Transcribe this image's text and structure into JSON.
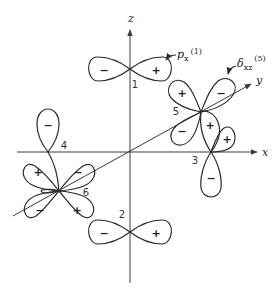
{
  "diagram": {
    "type": "orbital-overlap-diagram",
    "axes": {
      "z_label": "z",
      "x_label": "x",
      "y_label": "y"
    },
    "orbitals": [
      {
        "id": "1",
        "position_label": "1",
        "lobes": [
          {
            "sign": "−"
          },
          {
            "sign": "+"
          }
        ]
      },
      {
        "id": "2",
        "position_label": "2",
        "lobes": [
          {
            "sign": "−"
          },
          {
            "sign": "+"
          }
        ]
      },
      {
        "id": "3",
        "position_label": "3",
        "lobes": [
          {
            "sign": "+"
          },
          {
            "sign": "−"
          },
          {
            "sign": "+"
          }
        ]
      },
      {
        "id": "4",
        "position_label": "4",
        "lobes": [
          {
            "sign": "−"
          }
        ]
      },
      {
        "id": "5",
        "position_label": "5",
        "lobes": [
          {
            "sign": "+"
          },
          {
            "sign": "−"
          },
          {
            "sign": "−"
          },
          {
            "sign": "+"
          }
        ]
      },
      {
        "id": "6",
        "position_label": "6",
        "lobes": [
          {
            "sign": "+"
          },
          {
            "sign": "−"
          },
          {
            "sign": "−"
          },
          {
            "sign": "+"
          }
        ]
      }
    ],
    "callouts": [
      {
        "name": "p_x",
        "main": "p",
        "sub": "x",
        "sup": "(1)"
      },
      {
        "name": "delta_xz",
        "main": "δ",
        "sub": "xz",
        "sup": "(5)"
      }
    ]
  }
}
